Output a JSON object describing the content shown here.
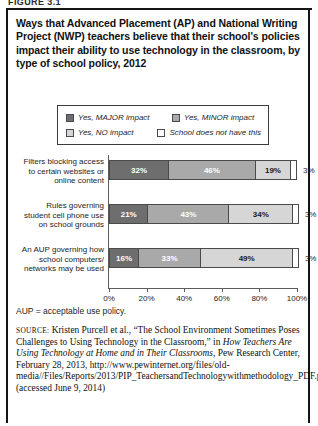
{
  "figure": {
    "label": "FIGURE 3.1"
  },
  "title": "Ways that Advanced Placement (AP) and National Writing Project (NWP) teachers believe that their school's policies impact their ability to use technology in the classroom, by type of school policy, 2012",
  "legend": {
    "items": [
      {
        "label": "Yes, MAJOR impact",
        "color": "#6e6e6e"
      },
      {
        "label": "Yes, MINOR impact",
        "color": "#a9a9a9"
      },
      {
        "label": "Yes, NO impact",
        "color": "#d6d6d6"
      },
      {
        "label": "School does not have this",
        "color": "#ffffff"
      }
    ]
  },
  "note": "AUP = acceptable use policy.",
  "source": {
    "prefix": "SOURCE:",
    "text_1": " Kristen Purcell et al., “The School Environment Sometimes Poses Challenges to Using Technology in the Classroom,” in ",
    "italic_1": "How Teachers Are Using Technology at Home and in Their Classrooms,",
    "text_2": " Pew Research Center, February 28, 2013, http://www.pewinternet.org/files/old-media//Files/Reports/2013/PIP_TeachersandTechnologywithmethodology_PDF.pdf (accessed June 9, 2014)"
  },
  "chart_data": {
    "type": "bar",
    "orientation": "horizontal",
    "stacked": true,
    "stacked_percent": true,
    "title": "Ways that Advanced Placement (AP) and National Writing Project (NWP) teachers believe that their school's policies impact their ability to use technology in the classroom, by type of school policy, 2012",
    "xlabel": "",
    "ylabel": "",
    "xlim": [
      0,
      100
    ],
    "xticks": [
      "0%",
      "20%",
      "40%",
      "60%",
      "80%",
      "100%"
    ],
    "xtick_values": [
      0,
      20,
      40,
      60,
      80,
      100
    ],
    "grid": false,
    "legend_position": "top",
    "categories": [
      "Filters blocking access to certain websites or online content",
      "Rules governing student cell phone use on school grounds",
      "An AUP governing how school computers/ networks may be used"
    ],
    "series": [
      {
        "name": "Yes, MAJOR impact",
        "color": "#6e6e6e",
        "values": [
          32,
          21,
          16
        ],
        "labels": [
          "32%",
          "21%",
          "16%"
        ]
      },
      {
        "name": "Yes, MINOR impact",
        "color": "#a9a9a9",
        "values": [
          46,
          43,
          33
        ],
        "labels": [
          "46%",
          "43%",
          "33%"
        ]
      },
      {
        "name": "Yes, NO impact",
        "color": "#d6d6d6",
        "values": [
          19,
          34,
          49
        ],
        "labels": [
          "19%",
          "34%",
          "49%"
        ]
      },
      {
        "name": "School does not have this",
        "color": "#ffffff",
        "values": [
          3,
          3,
          3
        ],
        "labels": [
          "3%",
          "3%",
          "3%"
        ]
      }
    ],
    "outside_labels": [
      "3%",
      "3%",
      "3%"
    ]
  },
  "bars": [
    {
      "category_lines": [
        "Filters blocking access",
        "to certain websites or",
        "online content"
      ],
      "segments": [
        {
          "value": 32,
          "label": "32%",
          "color": "#6e6e6e",
          "text_dark": false,
          "show": true
        },
        {
          "value": 46,
          "label": "46%",
          "color": "#a9a9a9",
          "text_dark": false,
          "show": true
        },
        {
          "value": 19,
          "label": "19%",
          "color": "#d6d6d6",
          "text_dark": true,
          "show": true
        },
        {
          "value": 3,
          "label": "",
          "color": "#ffffff",
          "text_dark": true,
          "show": false
        }
      ],
      "outside_label": "3%"
    },
    {
      "category_lines": [
        "Rules governing",
        "student cell phone use",
        "on school grounds"
      ],
      "segments": [
        {
          "value": 21,
          "label": "21%",
          "color": "#6e6e6e",
          "text_dark": false,
          "show": true
        },
        {
          "value": 43,
          "label": "43%",
          "color": "#a9a9a9",
          "text_dark": false,
          "show": true
        },
        {
          "value": 34,
          "label": "34%",
          "color": "#d6d6d6",
          "text_dark": true,
          "show": true
        },
        {
          "value": 3,
          "label": "",
          "color": "#ffffff",
          "text_dark": true,
          "show": false
        }
      ],
      "outside_label": "3%"
    },
    {
      "category_lines": [
        "An AUP governing how",
        "school computers/",
        "networks may be used"
      ],
      "segments": [
        {
          "value": 16,
          "label": "16%",
          "color": "#6e6e6e",
          "text_dark": false,
          "show": true
        },
        {
          "value": 33,
          "label": "33%",
          "color": "#a9a9a9",
          "text_dark": false,
          "show": true
        },
        {
          "value": 49,
          "label": "49%",
          "color": "#d6d6d6",
          "text_dark": true,
          "show": true
        },
        {
          "value": 3,
          "label": "",
          "color": "#ffffff",
          "text_dark": true,
          "show": false
        }
      ],
      "outside_label": "3%"
    }
  ]
}
